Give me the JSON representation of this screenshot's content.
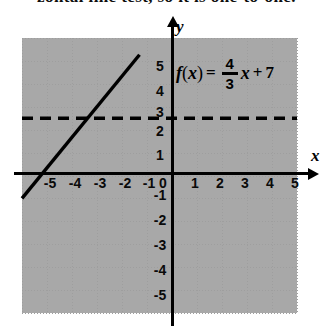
{
  "figure": {
    "clipped_header_text": "zontal line test, so it is one-to-one.",
    "equation": {
      "function_name": "f",
      "open_paren": "(",
      "argument": "x",
      "close_paren": ")",
      "equals": "=",
      "fraction_numerator": "4",
      "fraction_denominator": "3",
      "variable": "x",
      "plus": "+",
      "constant": "7",
      "full_text": "f(x) = 4/3 x + 7"
    },
    "axes": {
      "x_label": "x",
      "y_label": "y",
      "origin_label": "0"
    },
    "x_ticks": [
      "-5",
      "-4",
      "-3",
      "-2",
      "-1",
      "1",
      "2",
      "3",
      "4",
      "5"
    ],
    "y_ticks": [
      "5",
      "4",
      "3",
      "2",
      "1",
      "-1",
      "-2",
      "-3",
      "-4",
      "-5"
    ],
    "colors": {
      "axis": "#000000",
      "grid": "#9e9e9e",
      "curve": "#000000",
      "dashed": "#000000",
      "background": "#ffffff"
    }
  },
  "chart_data": {
    "type": "line",
    "title": "",
    "subtitle": "",
    "xlabel": "x",
    "ylabel": "y",
    "xlim": [
      -6,
      5
    ],
    "ylim": [
      -6,
      6
    ],
    "xticks": [
      -5,
      -4,
      -3,
      -2,
      -1,
      0,
      1,
      2,
      3,
      4,
      5
    ],
    "yticks": [
      -5,
      -4,
      -3,
      -2,
      -1,
      0,
      1,
      2,
      3,
      4,
      5
    ],
    "grid": true,
    "grid_style": "dotted",
    "grid_spacing": 1,
    "legend": false,
    "legend_position": "none",
    "annotations": [
      {
        "text": "f(x) = 4/3 x + 7",
        "x": 0.2,
        "y": 4.7,
        "kind": "equation-label"
      }
    ],
    "series": [
      {
        "name": "f(x) = 4/3 x + 7",
        "type": "line",
        "style": "solid",
        "slope": 1.3333,
        "intercept": 7,
        "x_intercept": -5.25,
        "y_intercept": 7,
        "linewidth": 3,
        "color": "#000000",
        "points": [
          {
            "x": -6.0,
            "y": -1.0
          },
          {
            "x": -5.25,
            "y": 0.0
          },
          {
            "x": -3.0,
            "y": 3.0
          },
          {
            "x": -1.3,
            "y": 5.27
          }
        ],
        "drawn_from": {
          "x": -6.0,
          "y": -1.0
        },
        "drawn_to": {
          "x": -1.3,
          "y": 5.27
        }
      },
      {
        "name": "horizontal asymptote reference",
        "type": "line",
        "style": "dashed",
        "slope": 0,
        "y_value": 2.5,
        "linewidth": 3,
        "color": "#000000",
        "points": [
          {
            "x": -6.0,
            "y": 2.5
          },
          {
            "x": 5.0,
            "y": 2.5
          }
        ],
        "drawn_from": {
          "x": -6.0,
          "y": 2.5
        },
        "drawn_to": {
          "x": 5.0,
          "y": 2.5
        }
      }
    ]
  }
}
